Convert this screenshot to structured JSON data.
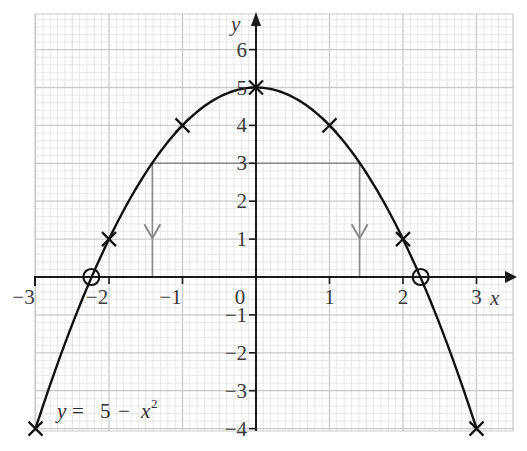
{
  "chart_data": {
    "type": "line",
    "title": "",
    "equation_label": "y = 5 − x²",
    "xlabel": "x",
    "ylabel": "y",
    "xlim": [
      -3,
      3
    ],
    "ylim": [
      -4,
      6
    ],
    "x_ticks": [
      -3,
      -2,
      -1,
      0,
      1,
      2,
      3
    ],
    "x_tick_labels": [
      "−3",
      "−2",
      "−1",
      "0",
      "1",
      "2",
      "3"
    ],
    "y_ticks": [
      -4,
      -3,
      -2,
      -1,
      1,
      2,
      3,
      4,
      5,
      6
    ],
    "y_tick_labels": [
      "−4",
      "−3",
      "−2",
      "−1",
      "1",
      "2",
      "3",
      "4",
      "5",
      "6"
    ],
    "grid": true,
    "series": [
      {
        "name": "y = 5 − x²",
        "type": "curve",
        "function": "5 - x^2",
        "x_range": [
          -3,
          3
        ]
      }
    ],
    "plotted_points": [
      {
        "x": -3,
        "y": -4,
        "marker": "cross"
      },
      {
        "x": -2,
        "y": 1,
        "marker": "cross"
      },
      {
        "x": -1,
        "y": 4,
        "marker": "cross"
      },
      {
        "x": 0,
        "y": 5,
        "marker": "cross"
      },
      {
        "x": 1,
        "y": 4,
        "marker": "cross"
      },
      {
        "x": 2,
        "y": 1,
        "marker": "cross"
      },
      {
        "x": 3,
        "y": -4,
        "marker": "cross"
      }
    ],
    "roots": [
      {
        "x": -2.24,
        "y": 0,
        "marker": "circle"
      },
      {
        "x": 2.24,
        "y": 0,
        "marker": "circle"
      }
    ],
    "annotations": [
      {
        "type": "guide_line_horizontal",
        "y": 3,
        "x_from": -1.41,
        "x_to": 1.41,
        "color": "#8a8a8a"
      },
      {
        "type": "guide_line_vertical_arrow_down",
        "x": -1.41,
        "y_from": 3,
        "y_to": 0,
        "color": "#8a8a8a"
      },
      {
        "type": "guide_line_vertical_arrow_down",
        "x": 1.41,
        "y_from": 3,
        "y_to": 0,
        "color": "#8a8a8a"
      }
    ]
  },
  "labels": {
    "x_axis": "x",
    "y_axis": "y",
    "origin": "0",
    "equation_lhs": "y =",
    "equation_rhs": "5 − x",
    "equation_exp": "2"
  },
  "colors": {
    "curve": "#111111",
    "axes": "#1a1a1a",
    "guide": "#8a8a8a",
    "grid_minor": "#e2e2e2",
    "grid_major": "#c9c9c9"
  }
}
